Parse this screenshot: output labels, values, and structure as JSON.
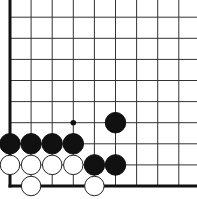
{
  "diagram": {
    "type": "go-board-corner",
    "grid": {
      "origin_x": 10,
      "origin_y": 186,
      "spacing": 21.1,
      "cols": 9,
      "rows": 9,
      "line_color": "#333333",
      "edge_color": "#111111"
    },
    "stones": [
      {
        "color": "black",
        "col": 0,
        "row": 2
      },
      {
        "color": "black",
        "col": 1,
        "row": 2
      },
      {
        "color": "black",
        "col": 2,
        "row": 2
      },
      {
        "color": "black",
        "col": 3,
        "row": 2
      },
      {
        "color": "black",
        "col": 5,
        "row": 3
      },
      {
        "color": "black",
        "col": 4,
        "row": 1
      },
      {
        "color": "black",
        "col": 5,
        "row": 1
      },
      {
        "color": "white",
        "col": 0,
        "row": 1
      },
      {
        "color": "white",
        "col": 1,
        "row": 1
      },
      {
        "color": "white",
        "col": 2,
        "row": 1
      },
      {
        "color": "white",
        "col": 3,
        "row": 1
      },
      {
        "color": "white",
        "col": 1,
        "row": 0
      },
      {
        "color": "white",
        "col": 4,
        "row": 0
      }
    ],
    "markers": [
      {
        "type": "dot",
        "col": 3,
        "row": 3
      }
    ]
  }
}
